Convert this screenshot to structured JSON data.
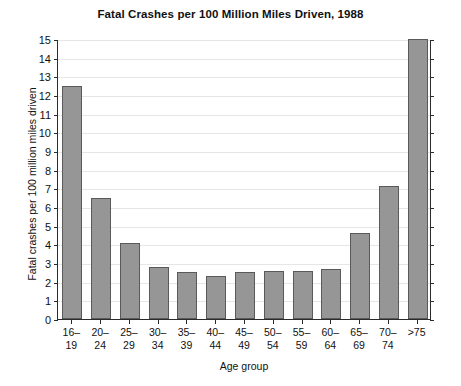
{
  "chart_data": {
    "type": "bar",
    "title": "Fatal Crashes per 100 Million Miles Driven, 1988",
    "xlabel": "Age group",
    "ylabel": "Fatal crashes per 100 million miles driven",
    "categories": [
      "16–19",
      "20–24",
      "25–29",
      "30–34",
      "35–39",
      "40–44",
      "45–49",
      "50–54",
      "55–59",
      "60–64",
      "65–69",
      "70–74",
      ">75"
    ],
    "values": [
      12.5,
      6.5,
      4.05,
      2.8,
      2.5,
      2.3,
      2.5,
      2.55,
      2.55,
      2.7,
      4.6,
      7.1,
      15.0
    ],
    "ylim": [
      0,
      15
    ],
    "ytick_labels": [
      "0",
      "1",
      "2",
      "3",
      "4",
      "5",
      "6",
      "7",
      "8",
      "9",
      "10",
      "11",
      "12",
      "13",
      "14",
      "15"
    ],
    "ytick_values": [
      0,
      1,
      2,
      3,
      4,
      5,
      6,
      7,
      8,
      9,
      10,
      11,
      12,
      13,
      14,
      15
    ],
    "grid": true,
    "legend": null,
    "bar_color": "#969696",
    "bar_border_color": "#5a5a5a",
    "grid_color": "#e6e6e6",
    "axis_color": "#2b2b2b",
    "background_color": "#ffffff"
  }
}
